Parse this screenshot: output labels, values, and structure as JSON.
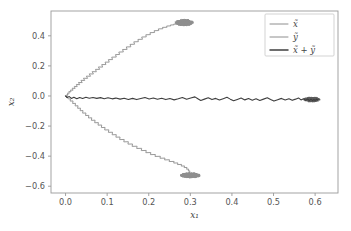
{
  "chart_data": {
    "type": "line",
    "title": "",
    "xlabel": "x₁",
    "ylabel": "x₂",
    "xlim": [
      -0.035,
      0.655
    ],
    "ylim": [
      -0.645,
      0.565
    ],
    "xticks": [
      "0.0",
      "0.1",
      "0.2",
      "0.3",
      "0.4",
      "0.5",
      "0.6"
    ],
    "xtick_values": [
      0.0,
      0.1,
      0.2,
      0.3,
      0.4,
      0.5,
      0.6
    ],
    "yticks": [
      "0.4",
      "0.2",
      "0.0",
      "−0.2",
      "−0.4",
      "−0.6"
    ],
    "ytick_values": [
      0.4,
      0.2,
      0.0,
      -0.2,
      -0.4,
      -0.6
    ],
    "grid": false,
    "legend_position": "upper right",
    "series": [
      {
        "name": "x̃",
        "label": "x̃",
        "color": "#8e8e8e",
        "linewidth": 0.9,
        "description": "noisy random-walk branch rising to upper-right, terminating in dense cluster near (0.28, 0.49)",
        "endpoint": [
          0.283,
          0.487
        ],
        "points": [
          [
            0.0,
            0.0
          ],
          [
            0.0015,
            -0.004
          ],
          [
            0.003,
            0.004
          ],
          [
            0.0028,
            -0.006
          ],
          [
            0.004,
            0.002
          ],
          [
            0.0035,
            0.012
          ],
          [
            0.006,
            0.008
          ],
          [
            0.005,
            0.02
          ],
          [
            0.009,
            0.018
          ],
          [
            0.008,
            0.03
          ],
          [
            0.013,
            0.027
          ],
          [
            0.012,
            0.04
          ],
          [
            0.018,
            0.038
          ],
          [
            0.016,
            0.052
          ],
          [
            0.023,
            0.05
          ],
          [
            0.021,
            0.064
          ],
          [
            0.028,
            0.062
          ],
          [
            0.026,
            0.077
          ],
          [
            0.034,
            0.075
          ],
          [
            0.031,
            0.09
          ],
          [
            0.04,
            0.089
          ],
          [
            0.037,
            0.104
          ],
          [
            0.046,
            0.103
          ],
          [
            0.043,
            0.118
          ],
          [
            0.053,
            0.117
          ],
          [
            0.05,
            0.132
          ],
          [
            0.06,
            0.131
          ],
          [
            0.057,
            0.147
          ],
          [
            0.067,
            0.146
          ],
          [
            0.064,
            0.162
          ],
          [
            0.074,
            0.161
          ],
          [
            0.072,
            0.177
          ],
          [
            0.082,
            0.177
          ],
          [
            0.079,
            0.193
          ],
          [
            0.089,
            0.192
          ],
          [
            0.087,
            0.209
          ],
          [
            0.097,
            0.209
          ],
          [
            0.095,
            0.225
          ],
          [
            0.105,
            0.225
          ],
          [
            0.103,
            0.242
          ],
          [
            0.113,
            0.242
          ],
          [
            0.111,
            0.258
          ],
          [
            0.122,
            0.259
          ],
          [
            0.12,
            0.275
          ],
          [
            0.13,
            0.276
          ],
          [
            0.128,
            0.292
          ],
          [
            0.139,
            0.293
          ],
          [
            0.137,
            0.309
          ],
          [
            0.148,
            0.31
          ],
          [
            0.146,
            0.326
          ],
          [
            0.157,
            0.327
          ],
          [
            0.155,
            0.343
          ],
          [
            0.166,
            0.344
          ],
          [
            0.164,
            0.36
          ],
          [
            0.175,
            0.361
          ],
          [
            0.174,
            0.376
          ],
          [
            0.185,
            0.377
          ],
          [
            0.183,
            0.392
          ],
          [
            0.194,
            0.393
          ],
          [
            0.193,
            0.407
          ],
          [
            0.204,
            0.408
          ],
          [
            0.203,
            0.421
          ],
          [
            0.214,
            0.422
          ],
          [
            0.213,
            0.434
          ],
          [
            0.224,
            0.435
          ],
          [
            0.223,
            0.446
          ],
          [
            0.234,
            0.447
          ],
          [
            0.233,
            0.456
          ],
          [
            0.244,
            0.457
          ],
          [
            0.243,
            0.465
          ],
          [
            0.253,
            0.466
          ],
          [
            0.252,
            0.472
          ],
          [
            0.261,
            0.473
          ],
          [
            0.26,
            0.478
          ],
          [
            0.268,
            0.479
          ],
          [
            0.267,
            0.483
          ],
          [
            0.274,
            0.484
          ],
          [
            0.273,
            0.486
          ],
          [
            0.279,
            0.487
          ],
          [
            0.283,
            0.487
          ]
        ],
        "cluster": {
          "cx": 0.285,
          "cy": 0.488,
          "rx": 0.022,
          "ry": 0.021
        }
      },
      {
        "name": "ỹ",
        "label": "ỹ",
        "color": "#8e8e8e",
        "linewidth": 0.9,
        "description": "noisy random-walk branch descending to lower-right, terminating in dense cluster near (0.30, -0.53)",
        "endpoint": [
          0.302,
          -0.53
        ],
        "points": [
          [
            0.0,
            0.0
          ],
          [
            0.002,
            -0.008
          ],
          [
            0.001,
            -0.002
          ],
          [
            0.004,
            -0.014
          ],
          [
            0.003,
            -0.006
          ],
          [
            0.007,
            -0.02
          ],
          [
            0.012,
            -0.019
          ],
          [
            0.011,
            -0.034
          ],
          [
            0.018,
            -0.033
          ],
          [
            0.017,
            -0.05
          ],
          [
            0.024,
            -0.049
          ],
          [
            0.023,
            -0.066
          ],
          [
            0.03,
            -0.065
          ],
          [
            0.029,
            -0.082
          ],
          [
            0.036,
            -0.081
          ],
          [
            0.035,
            -0.098
          ],
          [
            0.042,
            -0.097
          ],
          [
            0.041,
            -0.114
          ],
          [
            0.049,
            -0.113
          ],
          [
            0.048,
            -0.13
          ],
          [
            0.056,
            -0.129
          ],
          [
            0.055,
            -0.146
          ],
          [
            0.063,
            -0.145
          ],
          [
            0.062,
            -0.162
          ],
          [
            0.071,
            -0.161
          ],
          [
            0.07,
            -0.178
          ],
          [
            0.079,
            -0.177
          ],
          [
            0.078,
            -0.194
          ],
          [
            0.087,
            -0.193
          ],
          [
            0.086,
            -0.21
          ],
          [
            0.095,
            -0.209
          ],
          [
            0.094,
            -0.226
          ],
          [
            0.104,
            -0.225
          ],
          [
            0.103,
            -0.242
          ],
          [
            0.113,
            -0.241
          ],
          [
            0.112,
            -0.258
          ],
          [
            0.122,
            -0.257
          ],
          [
            0.121,
            -0.274
          ],
          [
            0.131,
            -0.273
          ],
          [
            0.13,
            -0.29
          ],
          [
            0.141,
            -0.289
          ],
          [
            0.14,
            -0.305
          ],
          [
            0.151,
            -0.304
          ],
          [
            0.15,
            -0.32
          ],
          [
            0.161,
            -0.319
          ],
          [
            0.16,
            -0.335
          ],
          [
            0.172,
            -0.334
          ],
          [
            0.171,
            -0.349
          ],
          [
            0.183,
            -0.348
          ],
          [
            0.182,
            -0.363
          ],
          [
            0.194,
            -0.362
          ],
          [
            0.193,
            -0.377
          ],
          [
            0.205,
            -0.376
          ],
          [
            0.204,
            -0.39
          ],
          [
            0.216,
            -0.389
          ],
          [
            0.215,
            -0.402
          ],
          [
            0.228,
            -0.401
          ],
          [
            0.227,
            -0.414
          ],
          [
            0.239,
            -0.413
          ],
          [
            0.238,
            -0.425
          ],
          [
            0.25,
            -0.424
          ],
          [
            0.249,
            -0.436
          ],
          [
            0.261,
            -0.435
          ],
          [
            0.26,
            -0.446
          ],
          [
            0.27,
            -0.445
          ],
          [
            0.269,
            -0.456
          ],
          [
            0.279,
            -0.455
          ],
          [
            0.278,
            -0.466
          ],
          [
            0.286,
            -0.465
          ],
          [
            0.285,
            -0.476
          ],
          [
            0.292,
            -0.475
          ],
          [
            0.291,
            -0.487
          ],
          [
            0.296,
            -0.486
          ],
          [
            0.295,
            -0.499
          ],
          [
            0.299,
            -0.498
          ],
          [
            0.298,
            -0.511
          ],
          [
            0.301,
            -0.519
          ],
          [
            0.302,
            -0.527
          ],
          [
            0.302,
            -0.53
          ]
        ],
        "cluster": {
          "cx": 0.3,
          "cy": -0.528,
          "rx": 0.024,
          "ry": 0.017
        }
      },
      {
        "name": "x̃ + ỹ",
        "label": "x̃ + ỹ",
        "color": "#3f3f3f",
        "linewidth": 1.1,
        "description": "near-horizontal noisy trace along x2 ~ -0.015, advancing right to dense cluster near (0.59, -0.02)",
        "endpoint": [
          0.607,
          -0.022
        ],
        "points": [
          [
            0.0,
            0.0
          ],
          [
            0.004,
            -0.01
          ],
          [
            0.009,
            -0.004
          ],
          [
            0.014,
            -0.016
          ],
          [
            0.02,
            -0.008
          ],
          [
            0.027,
            -0.018
          ],
          [
            0.034,
            -0.01
          ],
          [
            0.041,
            -0.017
          ],
          [
            0.049,
            -0.009
          ],
          [
            0.057,
            -0.015
          ],
          [
            0.066,
            -0.01
          ],
          [
            0.075,
            -0.016
          ],
          [
            0.084,
            -0.011
          ],
          [
            0.093,
            -0.018
          ],
          [
            0.102,
            -0.012
          ],
          [
            0.112,
            -0.019
          ],
          [
            0.121,
            -0.014
          ],
          [
            0.131,
            -0.021
          ],
          [
            0.141,
            -0.015
          ],
          [
            0.151,
            -0.023
          ],
          [
            0.161,
            -0.016
          ],
          [
            0.171,
            -0.024
          ],
          [
            0.181,
            -0.017
          ],
          [
            0.191,
            -0.01
          ],
          [
            0.201,
            -0.02
          ],
          [
            0.211,
            -0.013
          ],
          [
            0.221,
            -0.022
          ],
          [
            0.231,
            -0.015
          ],
          [
            0.241,
            -0.024
          ],
          [
            0.251,
            -0.017
          ],
          [
            0.261,
            -0.026
          ],
          [
            0.271,
            -0.019
          ],
          [
            0.281,
            -0.01
          ],
          [
            0.291,
            -0.022
          ],
          [
            0.301,
            -0.014
          ],
          [
            0.311,
            -0.006
          ],
          [
            0.318,
            -0.018
          ],
          [
            0.325,
            -0.03
          ],
          [
            0.334,
            -0.021
          ],
          [
            0.343,
            -0.012
          ],
          [
            0.352,
            -0.024
          ],
          [
            0.361,
            -0.016
          ],
          [
            0.37,
            -0.027
          ],
          [
            0.379,
            -0.018
          ],
          [
            0.388,
            -0.009
          ],
          [
            0.396,
            -0.021
          ],
          [
            0.404,
            -0.032
          ],
          [
            0.413,
            -0.023
          ],
          [
            0.422,
            -0.014
          ],
          [
            0.431,
            -0.026
          ],
          [
            0.44,
            -0.017
          ],
          [
            0.449,
            -0.028
          ],
          [
            0.458,
            -0.019
          ],
          [
            0.467,
            -0.03
          ],
          [
            0.476,
            -0.021
          ],
          [
            0.485,
            -0.012
          ],
          [
            0.493,
            -0.024
          ],
          [
            0.501,
            -0.034
          ],
          [
            0.51,
            -0.025
          ],
          [
            0.519,
            -0.016
          ],
          [
            0.528,
            -0.027
          ],
          [
            0.537,
            -0.019
          ],
          [
            0.545,
            -0.029
          ],
          [
            0.553,
            -0.021
          ],
          [
            0.56,
            -0.013
          ],
          [
            0.566,
            -0.026
          ],
          [
            0.572,
            -0.018
          ],
          [
            0.577,
            -0.029
          ],
          [
            0.582,
            -0.02
          ],
          [
            0.586,
            -0.03
          ],
          [
            0.59,
            -0.021
          ],
          [
            0.594,
            -0.031
          ],
          [
            0.597,
            -0.022
          ],
          [
            0.6,
            -0.03
          ],
          [
            0.603,
            -0.021
          ],
          [
            0.605,
            -0.028
          ],
          [
            0.607,
            -0.022
          ]
        ],
        "cluster": {
          "cx": 0.592,
          "cy": -0.023,
          "rx": 0.02,
          "ry": 0.016
        }
      }
    ]
  },
  "legend": {
    "entries": [
      {
        "label": "x̃",
        "color": "#8e8e8e"
      },
      {
        "label": "ỹ",
        "color": "#8e8e8e"
      },
      {
        "label": "x̃ + ỹ",
        "color": "#3f3f3f"
      }
    ]
  },
  "axes": {
    "xlabel": "x₁",
    "ylabel": "x₂"
  }
}
